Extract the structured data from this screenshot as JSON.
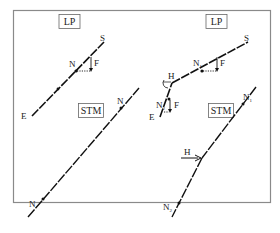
{
  "figure": {
    "frame": {
      "stroke": "#888888"
    },
    "panels": [
      {
        "id": "lp-left",
        "title": "LP",
        "labels": {
          "top": "S",
          "bottom": "E",
          "node": "N",
          "force": "F"
        }
      },
      {
        "id": "lp-right",
        "title": "LP",
        "labels": {
          "top": "S",
          "bottom": "E",
          "node_upper": "N",
          "node_upper_sub": "1",
          "node_lower": "N",
          "node_lower_sub": "2",
          "force_upper": "F",
          "force_lower": "F",
          "kink": "H"
        }
      },
      {
        "id": "stm-left",
        "title": "STM",
        "labels": {
          "node_top": "N",
          "node_bottom": "N"
        }
      },
      {
        "id": "stm-right",
        "title": "STM",
        "labels": {
          "node_top": "N",
          "node_top_sub": "1",
          "node_bottom": "N",
          "node_bottom_sub": "2",
          "kink_force": "H"
        }
      }
    ]
  }
}
